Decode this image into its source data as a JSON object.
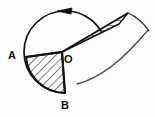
{
  "figure": {
    "type": "geometry-diagram",
    "background_color": "#fdfdfd",
    "stroke_color": "#111111",
    "hatch_color": "#111111",
    "labels": [
      {
        "id": "A",
        "text": "A",
        "x": 8,
        "y": 50,
        "role": "point-on-circle"
      },
      {
        "id": "O",
        "text": "O",
        "x": 64,
        "y": 54,
        "role": "circle-center"
      },
      {
        "id": "B",
        "text": "B",
        "x": 61,
        "y": 100,
        "role": "point-on-circle"
      }
    ],
    "geometry": {
      "center": {
        "x": 62,
        "y": 52
      },
      "radius": 40,
      "point_A": {
        "x": 26,
        "y": 57
      },
      "point_B": {
        "x": 65,
        "y": 94
      },
      "main_arc": {
        "description": "major arc of the circle from B counterclockwise around to A",
        "start": {
          "x": 65,
          "y": 94
        },
        "end": {
          "x": 26,
          "y": 57
        },
        "sweep": "counterclockwise-major"
      },
      "arrow": {
        "description": "arrowhead on top arc indicating counterclockwise direction",
        "tip": {
          "x": 59,
          "y": 11
        },
        "direction": "left",
        "angle_deg": 196
      },
      "sector_AOB": {
        "description": "hatched circular sector between radius OA and radius OB",
        "hatch_style": "diagonal-45",
        "vertices": [
          "A",
          "O",
          "B"
        ]
      },
      "wedge_outer": {
        "description": "narrow hatched wedge from O extending up and to the right past the circle",
        "hatch_style": "horizontal",
        "apex": {
          "x": 62,
          "y": 52
        },
        "upper_edge_end": {
          "x": 126,
          "y": 15
        },
        "lower_edge_end": {
          "x": 116,
          "y": 22
        }
      },
      "outer_arc_right": {
        "description": "faint outer arc on the right side of the figure",
        "start": {
          "x": 78,
          "y": 83
        },
        "end": {
          "x": 148,
          "y": 30
        }
      }
    }
  }
}
